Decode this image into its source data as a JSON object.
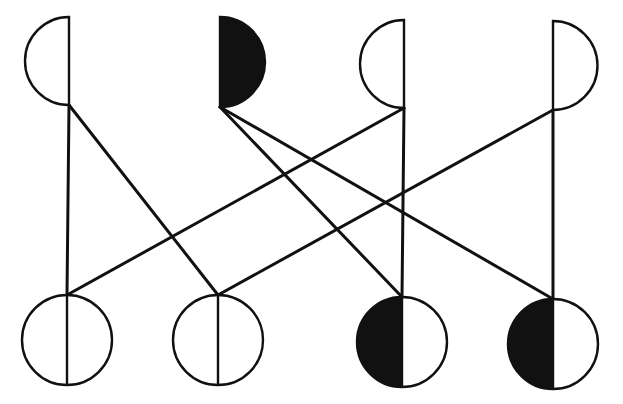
{
  "diagram": {
    "type": "pedigree-cross",
    "colors": {
      "ink": "#111111",
      "background": "#ffffff"
    },
    "top_nodes": [
      {
        "id": "T1",
        "shape": "half-disc",
        "bulge": "left",
        "filled": false,
        "x": 69,
        "y_top": 17,
        "y_bottom": 105
      },
      {
        "id": "T2",
        "shape": "half-disc",
        "bulge": "right",
        "filled": true,
        "x": 220,
        "y_top": 17,
        "y_bottom": 107
      },
      {
        "id": "T3",
        "shape": "half-disc",
        "bulge": "left",
        "filled": false,
        "x": 404,
        "y_top": 20,
        "y_bottom": 108
      },
      {
        "id": "T4",
        "shape": "half-disc",
        "bulge": "right",
        "filled": false,
        "x": 553,
        "y_top": 21,
        "y_bottom": 110
      }
    ],
    "bottom_nodes": [
      {
        "id": "B1",
        "shape": "split-circle",
        "filled_half": "none",
        "cx": 67,
        "cy": 340,
        "r": 45
      },
      {
        "id": "B2",
        "shape": "split-circle",
        "filled_half": "none",
        "cx": 218,
        "cy": 340,
        "r": 45
      },
      {
        "id": "B3",
        "shape": "split-circle",
        "filled_half": "left",
        "cx": 402,
        "cy": 342,
        "r": 45
      },
      {
        "id": "B4",
        "shape": "split-circle",
        "filled_half": "left",
        "cx": 553,
        "cy": 344,
        "r": 45
      }
    ],
    "edges": [
      {
        "from": "T1",
        "to": "B1"
      },
      {
        "from": "T1",
        "to": "B2"
      },
      {
        "from": "T2",
        "to": "B3"
      },
      {
        "from": "T2",
        "to": "B4"
      },
      {
        "from": "T3",
        "to": "B1"
      },
      {
        "from": "T3",
        "to": "B3"
      },
      {
        "from": "T4",
        "to": "B2"
      },
      {
        "from": "T4",
        "to": "B4"
      }
    ]
  }
}
